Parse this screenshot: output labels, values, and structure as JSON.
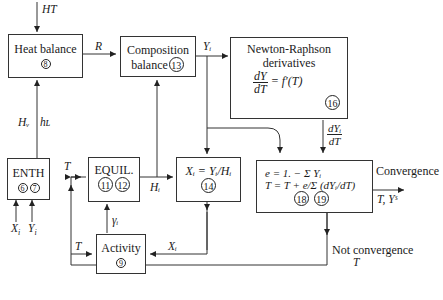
{
  "inputs": {
    "ht": "HT",
    "xi": "X",
    "yi": "Y",
    "sub_i": "i"
  },
  "boxes": {
    "heat_balance": {
      "label": "Heat balance",
      "eq": "8"
    },
    "composition_balance": {
      "line1": "Composition",
      "line2": "balance",
      "eq": "13"
    },
    "newton_raphson": {
      "line1": "Newton-Raphson",
      "line2": "derivatives",
      "num": "dY",
      "den": "dT",
      "rhs": "= f′(T)",
      "eq": "16"
    },
    "enth": {
      "label": "ENTH",
      "eq1": "6",
      "eq2": "7"
    },
    "equil": {
      "label": "EQUIL.",
      "eq1": "11",
      "eq2": "12"
    },
    "xi_calc": {
      "formula": "Xᵢ = Yᵢ/Hᵢ",
      "eq": "14"
    },
    "convergence_calc": {
      "line1": "e = 1. − Σ Yᵢ",
      "line2": "T = T + e/Σ (dYᵢ/dT)",
      "eq1": "18",
      "eq2": "19"
    },
    "activity": {
      "label": "Activity",
      "eq": "9"
    }
  },
  "arrows": {
    "r": "R",
    "yi_out": "Yᵢ",
    "hv": "Hᵥ",
    "hl": "hʟ",
    "t_enth": "T",
    "hi": "Hᵢ",
    "gamma": "γᵢ",
    "t_activity": "T",
    "xi_activity": "Xᵢ",
    "dyi_num": "dYᵢ",
    "dyi_den": "dT",
    "convergence": "Convergence",
    "convergence_out": "T, Yˢ",
    "not_convergence": "Not convergence",
    "not_convergence_t": "T"
  }
}
